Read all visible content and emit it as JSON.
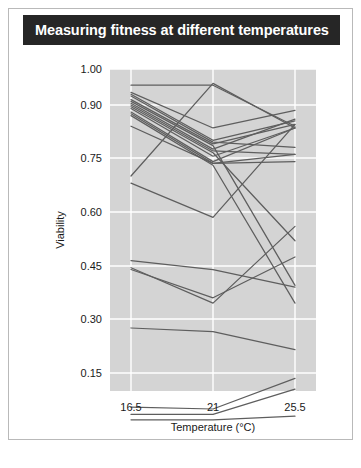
{
  "figure": {
    "title": "Measuring fitness at different temperatures"
  },
  "colors": {
    "title_bar": "#262626",
    "title_text": "#ffffff",
    "panel": "#d4d4d4",
    "gridline": "#ffffff",
    "line": "#5e5e5e",
    "border": "#b9b9b9",
    "tick_text": "#1a1a1a"
  },
  "chart_data": {
    "type": "line",
    "title": "Measuring fitness at different temperatures",
    "xlabel": "Temperature (°C)",
    "ylabel": "Viability",
    "x": [
      16.5,
      21,
      25.5
    ],
    "xtick_labels": [
      "16.5",
      "21",
      "25.5"
    ],
    "ytick_values": [
      0.15,
      0.3,
      0.45,
      0.6,
      0.75,
      0.9,
      1.0
    ],
    "ytick_labels": [
      "0.15",
      "0.30",
      "0.45",
      "0.60",
      "0.75",
      "0.90",
      "1.00"
    ],
    "ylim": [
      0.0,
      1.0
    ],
    "yscale": "nonlinear",
    "grid": true,
    "legend": "none",
    "n_series": 22,
    "series": [
      {
        "name": "genotype-1",
        "values": [
          0.955,
          0.955,
          0.84
        ]
      },
      {
        "name": "genotype-2",
        "values": [
          0.935,
          0.835,
          0.885
        ]
      },
      {
        "name": "genotype-3",
        "values": [
          0.93,
          0.8,
          0.855
        ]
      },
      {
        "name": "genotype-4",
        "values": [
          0.925,
          0.795,
          0.78
        ]
      },
      {
        "name": "genotype-5",
        "values": [
          0.915,
          0.79,
          0.845
        ]
      },
      {
        "name": "genotype-6",
        "values": [
          0.91,
          0.785,
          0.395
        ]
      },
      {
        "name": "genotype-7",
        "values": [
          0.905,
          0.775,
          0.86
        ]
      },
      {
        "name": "genotype-8",
        "values": [
          0.9,
          0.77,
          0.76
        ]
      },
      {
        "name": "genotype-9",
        "values": [
          0.895,
          0.765,
          0.52
        ]
      },
      {
        "name": "genotype-10",
        "values": [
          0.89,
          0.755,
          0.835
        ]
      },
      {
        "name": "genotype-11",
        "values": [
          0.88,
          0.74,
          0.835
        ]
      },
      {
        "name": "genotype-12",
        "values": [
          0.875,
          0.735,
          0.74
        ]
      },
      {
        "name": "genotype-13",
        "values": [
          0.87,
          0.73,
          0.345
        ]
      },
      {
        "name": "genotype-14",
        "values": [
          0.84,
          0.735,
          0.76
        ]
      },
      {
        "name": "genotype-15",
        "values": [
          0.7,
          0.96,
          0.835
        ]
      },
      {
        "name": "genotype-16",
        "values": [
          0.68,
          0.585,
          0.845
        ]
      },
      {
        "name": "genotype-17",
        "values": [
          0.465,
          0.44,
          0.39
        ]
      },
      {
        "name": "genotype-18",
        "values": [
          0.445,
          0.345,
          0.56
        ]
      },
      {
        "name": "genotype-19",
        "values": [
          0.44,
          0.36,
          0.475
        ]
      },
      {
        "name": "genotype-20",
        "values": [
          0.275,
          0.265,
          0.215
        ]
      },
      {
        "name": "genotype-21",
        "values": [
          0.055,
          0.05,
          0.135
        ]
      },
      {
        "name": "genotype-22",
        "values": [
          0.035,
          0.035,
          0.105
        ]
      },
      {
        "name": "genotype-23",
        "values": [
          0.02,
          0.02,
          0.03
        ]
      }
    ]
  }
}
